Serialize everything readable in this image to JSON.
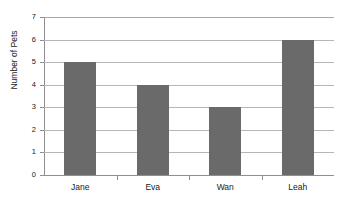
{
  "chart_data": {
    "type": "bar",
    "title": "",
    "categories": [
      "Jane",
      "Eva",
      "Wan",
      "Leah"
    ],
    "values": [
      5,
      4,
      3,
      6
    ],
    "series": [
      {
        "name": "Number of Pets",
        "values": [
          5,
          4,
          3,
          6
        ]
      }
    ],
    "xlabel": "",
    "ylabel": "Number of Pets",
    "ylim": [
      0,
      7
    ],
    "ytick_labels": [
      "0",
      "1",
      "2",
      "3",
      "4",
      "5",
      "6",
      "7"
    ],
    "ytick_values": [
      0,
      1,
      2,
      3,
      4,
      5,
      6,
      7
    ],
    "grid": true,
    "grid_axis": "y",
    "legend": false,
    "legend_position": "none",
    "bar_color": "#6a6a6a",
    "gridline_color": "#b6b6b6",
    "axis_color": "#8f8f8f",
    "background_color": "#ffffff",
    "orientation": "vertical"
  },
  "clipped_top_text": ""
}
